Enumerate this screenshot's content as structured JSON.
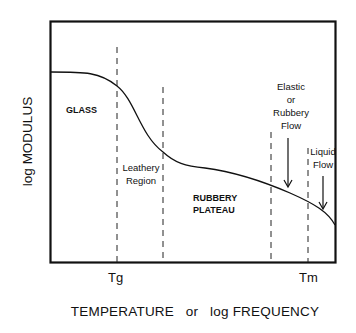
{
  "diagram": {
    "title": "",
    "y_axis_label": "log MODULUS",
    "x_axis_label": "TEMPERATURE   or   log FREQUENCY",
    "x_ticks": [
      {
        "label": "Tg"
      },
      {
        "label": "Tm"
      }
    ],
    "regions": [
      {
        "label": "GLASS"
      },
      {
        "label_line1": "Leathery",
        "label_line2": "Region"
      },
      {
        "label_line1": "RUBBERY",
        "label_line2": "PLATEAU"
      },
      {
        "label_line1": "Elastic",
        "label_line2": "or",
        "label_line3": "Rubbery",
        "label_line4": "Flow"
      },
      {
        "label_line1": "Liquid",
        "label_line2": "Flow"
      }
    ],
    "colors": {
      "line": "#111111",
      "background": "#ffffff"
    }
  }
}
